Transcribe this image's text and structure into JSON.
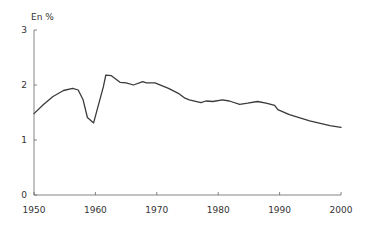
{
  "chart_data": {
    "type": "line",
    "title": "",
    "ylabel": "En %",
    "xlabel": "",
    "xlim": [
      1950,
      2000
    ],
    "ylim": [
      0,
      3
    ],
    "xticks": [
      1950,
      1960,
      1970,
      1980,
      1990,
      2000
    ],
    "yticks": [
      0,
      1,
      2,
      3
    ],
    "grid": false,
    "legend": null,
    "series": [
      {
        "name": "En %",
        "color": "#3a3a3a",
        "points": [
          [
            1950.0,
            1.48
          ],
          [
            1951.5,
            1.64
          ],
          [
            1953.1,
            1.79
          ],
          [
            1954.8,
            1.9
          ],
          [
            1956.3,
            1.94
          ],
          [
            1957.2,
            1.91
          ],
          [
            1958.0,
            1.73
          ],
          [
            1958.7,
            1.41
          ],
          [
            1959.7,
            1.31
          ],
          [
            1961.3,
            1.97
          ],
          [
            1961.7,
            2.18
          ],
          [
            1962.6,
            2.17
          ],
          [
            1964.0,
            2.05
          ],
          [
            1965.0,
            2.04
          ],
          [
            1966.2,
            2.0
          ],
          [
            1967.7,
            2.06
          ],
          [
            1968.3,
            2.04
          ],
          [
            1969.7,
            2.04
          ],
          [
            1971.9,
            1.94
          ],
          [
            1973.5,
            1.85
          ],
          [
            1974.6,
            1.76
          ],
          [
            1975.3,
            1.73
          ],
          [
            1977.2,
            1.68
          ],
          [
            1978.0,
            1.71
          ],
          [
            1979.1,
            1.7
          ],
          [
            1980.7,
            1.73
          ],
          [
            1981.8,
            1.71
          ],
          [
            1983.5,
            1.65
          ],
          [
            1984.8,
            1.67
          ],
          [
            1986.4,
            1.7
          ],
          [
            1987.8,
            1.67
          ],
          [
            1989.2,
            1.63
          ],
          [
            1989.7,
            1.55
          ],
          [
            1991.6,
            1.46
          ],
          [
            1994.9,
            1.35
          ],
          [
            1998.2,
            1.26
          ],
          [
            2000.0,
            1.23
          ]
        ]
      }
    ]
  },
  "labels": {
    "y_unit": "En %",
    "x_ticks": [
      "1950",
      "1960",
      "1970",
      "1980",
      "1990",
      "2000"
    ],
    "y_ticks": [
      "0",
      "1",
      "2",
      "3"
    ]
  }
}
